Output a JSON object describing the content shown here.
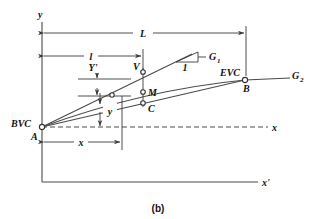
{
  "figure": {
    "caption": "(b)",
    "axes": {
      "y_axis_label": "y",
      "x_axis_label": "x",
      "x_prime_axis_label": "x'"
    },
    "points": [
      {
        "id": "A",
        "label": "A",
        "aux_label": "BVC",
        "x": 42,
        "y": 127
      },
      {
        "id": "V",
        "label": "V",
        "aux_label": "",
        "x": 143,
        "y": 72
      },
      {
        "id": "M",
        "label": "M",
        "aux_label": "",
        "x": 143,
        "y": 92
      },
      {
        "id": "C",
        "label": "C",
        "aux_label": "",
        "x": 143,
        "y": 103
      },
      {
        "id": "B",
        "label": "B",
        "aux_label": "EVC",
        "x": 245,
        "y": 80
      },
      {
        "id": "P",
        "label": "",
        "aux_label": "",
        "x": 112,
        "y": 95
      }
    ],
    "grade_lines": [
      {
        "id": "G1",
        "label": "G",
        "sub": "1"
      },
      {
        "id": "G2",
        "label": "G",
        "sub": "2"
      }
    ],
    "slope_marker": {
      "run_label": "1"
    },
    "dimensions": [
      {
        "id": "L",
        "label": "L",
        "from_x": 42,
        "to_x": 246,
        "y": 33,
        "orientation": "horizontal"
      },
      {
        "id": "l",
        "label": "l",
        "from_x": 42,
        "to_x": 143,
        "y": 56,
        "orientation": "horizontal"
      },
      {
        "id": "x",
        "label": "x",
        "from_x": 42,
        "to_x": 122,
        "y": 142,
        "orientation": "horizontal"
      },
      {
        "id": "Yprime",
        "label": "Y'",
        "from_y": 79,
        "to_y": 96,
        "x": 97,
        "orientation": "vertical"
      },
      {
        "id": "y",
        "label": "y",
        "from_y": 93,
        "to_y": 127,
        "x": 100,
        "orientation": "vertical"
      }
    ]
  }
}
